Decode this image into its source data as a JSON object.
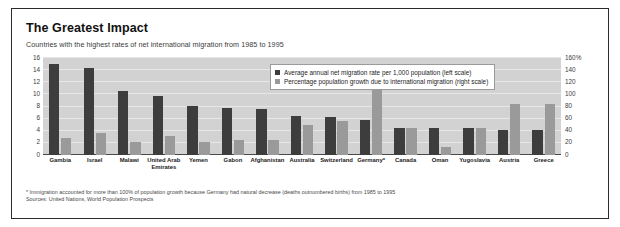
{
  "title": "The Greatest Impact",
  "subtitle": "Countries with the highest rates of net international migration from 1985 to 1995",
  "legend": {
    "items": [
      {
        "label": "Average annual net migration rate per 1,000 population (left scale)",
        "color": "#3d3d3d",
        "swatch_icon": "square-swatch-icon"
      },
      {
        "label": "Percentage population growth due to international migration (right scale)",
        "color": "#9a9a9a",
        "swatch_icon": "square-swatch-icon"
      }
    ]
  },
  "footnotes": [
    "* Immigration accounted for more than 100% of population growth because Germany had natural decrease (deaths outnumbered births) from 1985 to 1995",
    "Sources: United Nations, World Population Prospects"
  ],
  "chart_data": {
    "type": "bar",
    "title": "The Greatest Impact",
    "subtitle": "Countries with the highest rates of net international migration from 1985 to 1995",
    "xlabel": "",
    "ylabel": "",
    "grid": true,
    "legend_position": "top-right",
    "categories": [
      "Gambia",
      "Israel",
      "Malawi",
      "United Arab Emirates",
      "Yemen",
      "Gabon",
      "Afghanistan",
      "Australia",
      "Switzerland",
      "Germany*",
      "Canada",
      "Oman",
      "Yugoslavia",
      "Austria",
      "Greece"
    ],
    "series": [
      {
        "name": "Average annual net migration rate per 1,000 population (left scale)",
        "axis": "left",
        "color": "#3d3d3d",
        "values": [
          15.0,
          14.3,
          10.6,
          9.7,
          8.1,
          7.8,
          7.6,
          6.4,
          6.2,
          5.7,
          4.4,
          4.4,
          4.4,
          4.2,
          4.1
        ]
      },
      {
        "name": "Percentage population growth due to international migration (right scale)",
        "axis": "right",
        "color": "#9a9a9a",
        "values": [
          28,
          37,
          22,
          31,
          22,
          25,
          25,
          49,
          56,
          113,
          45,
          13,
          45,
          84,
          84
        ]
      }
    ],
    "left_axis": {
      "ticks": [
        0,
        2,
        4,
        6,
        8,
        10,
        12,
        14,
        16
      ],
      "tick_labels": [
        "0",
        "2",
        "4",
        "6",
        "8",
        "10",
        "12",
        "14",
        "16"
      ],
      "ylim": [
        0,
        16
      ]
    },
    "right_axis": {
      "ticks": [
        0,
        20,
        40,
        60,
        80,
        100,
        120,
        140,
        160
      ],
      "tick_labels": [
        "0",
        "20",
        "40",
        "60",
        "80",
        "100",
        "120",
        "140",
        "160%"
      ],
      "ylim": [
        0,
        160
      ]
    }
  }
}
